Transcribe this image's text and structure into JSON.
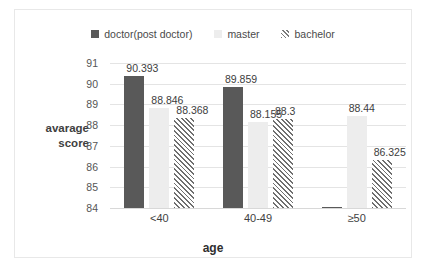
{
  "chart_data": {
    "type": "bar",
    "title": "",
    "subtitle": "",
    "xlabel": "age",
    "ylabel": "avarage score",
    "ylabel_line1": "avarage",
    "ylabel_line2": "score",
    "categories": [
      "<40",
      "40-49",
      "≥50"
    ],
    "ylim": [
      84,
      91
    ],
    "ytick_labels": [
      "91",
      "90",
      "89",
      "88",
      "87",
      "86",
      "85",
      "84"
    ],
    "ytick_values": [
      91,
      90,
      89,
      88,
      87,
      86,
      85,
      84
    ],
    "grid": true,
    "legend_position": "top",
    "series": [
      {
        "name": "doctor(post doctor)",
        "color": "#595959",
        "pattern": "solid",
        "values": [
          90.393,
          89.859,
          null
        ],
        "labels": [
          "90.393",
          "89.859",
          ""
        ]
      },
      {
        "name": "master",
        "color": "#ededed",
        "pattern": "solid",
        "values": [
          88.846,
          88.155,
          88.44
        ],
        "labels": [
          "88.846",
          "88.155",
          "88.44"
        ]
      },
      {
        "name": "bachelor",
        "color": "#6f6f6f",
        "pattern": "diagonal-hatch",
        "values": [
          88.368,
          88.3,
          86.325
        ],
        "labels": [
          "88.368",
          "88.3",
          "86.325"
        ]
      }
    ]
  },
  "legend": {
    "items": [
      {
        "label": "doctor(post doctor)",
        "swatch": "doctor-swatch-icon"
      },
      {
        "label": "master",
        "swatch": "master-swatch-icon"
      },
      {
        "label": "bachelor",
        "swatch": "bachelor-swatch-icon"
      }
    ]
  },
  "colors": {
    "doctor": "#595959",
    "master": "#ededed",
    "bachelor_hatch": "#6f6f6f",
    "gridline": "#e4e4e4",
    "border": "#e8e8e8",
    "text": "#3f3f3f"
  }
}
